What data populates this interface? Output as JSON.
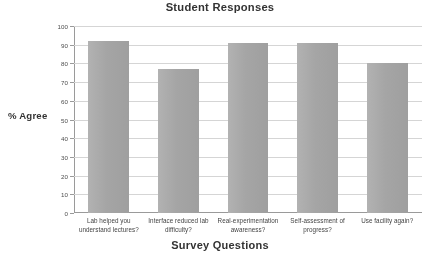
{
  "chart_data": {
    "type": "bar",
    "title": "Student Responses",
    "xlabel": "Survey Questions",
    "ylabel": "% Agree",
    "categories": [
      "Lab helped you understand lectures?",
      "Interface reduced lab difficulty?",
      "Real-experimentation awareness?",
      "Self-assessment of progress?",
      "Use facility again?"
    ],
    "values": [
      92,
      77,
      91,
      91,
      80
    ],
    "ylim": [
      0,
      100
    ],
    "ytick_labels": [
      "100",
      "90",
      "80",
      "70",
      "60",
      "50",
      "40",
      "30",
      "20",
      "10",
      "0"
    ],
    "ytick_values": [
      100,
      90,
      80,
      70,
      60,
      50,
      40,
      30,
      20,
      10,
      0
    ],
    "grid": true,
    "legend": false,
    "bar_color": "#a9a9a9",
    "background_color": "#ffffff",
    "gridline_color": "#d6d6d6",
    "axis_color": "#9a9a9a"
  }
}
